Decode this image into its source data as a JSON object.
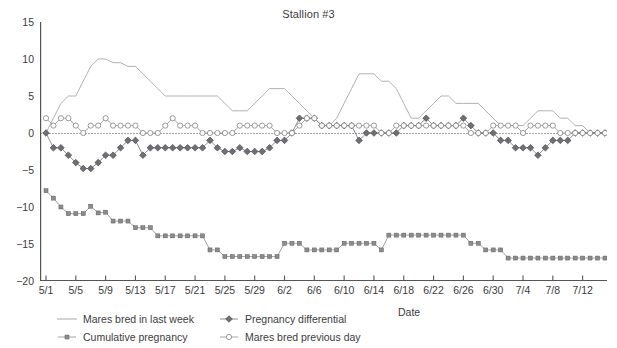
{
  "chart_data": {
    "type": "line",
    "title": "Stallion #3",
    "xlabel": "Date",
    "ylabel": "",
    "ylim": [
      -20,
      15
    ],
    "yticks": [
      15,
      10,
      5,
      0,
      -5,
      -10,
      -15,
      -20
    ],
    "grid": false,
    "zero_reference_line": true,
    "legend_position": "bottom-left",
    "x": [
      "5/1",
      "5/2",
      "5/3",
      "5/4",
      "5/5",
      "5/6",
      "5/7",
      "5/8",
      "5/9",
      "5/10",
      "5/11",
      "5/12",
      "5/13",
      "5/14",
      "5/15",
      "5/16",
      "5/17",
      "5/18",
      "5/19",
      "5/20",
      "5/21",
      "5/22",
      "5/23",
      "5/24",
      "5/25",
      "5/26",
      "5/27",
      "5/28",
      "5/29",
      "5/30",
      "5/31",
      "6/1",
      "6/2",
      "6/3",
      "6/4",
      "6/5",
      "6/6",
      "6/7",
      "6/8",
      "6/9",
      "6/10",
      "6/11",
      "6/12",
      "6/13",
      "6/14",
      "6/15",
      "6/16",
      "6/17",
      "6/18",
      "6/19",
      "6/20",
      "6/21",
      "6/22",
      "6/23",
      "6/24",
      "6/25",
      "6/26",
      "6/27",
      "6/28",
      "6/29",
      "6/30",
      "7/1",
      "7/2",
      "7/3",
      "7/4",
      "7/5",
      "7/6",
      "7/7",
      "7/8",
      "7/9",
      "7/10",
      "7/11",
      "7/12",
      "7/13",
      "7/14",
      "7/15"
    ],
    "xticks": [
      "5/1",
      "5/5",
      "5/9",
      "5/13",
      "5/17",
      "5/21",
      "5/25",
      "5/29",
      "6/2",
      "6/6",
      "6/10",
      "6/14",
      "6/18",
      "6/22",
      "6/26",
      "6/30",
      "7/4",
      "7/8",
      "7/12"
    ],
    "xtick_indices": [
      0,
      4,
      8,
      12,
      16,
      20,
      24,
      28,
      32,
      36,
      40,
      44,
      48,
      52,
      56,
      60,
      64,
      68,
      72
    ],
    "series": [
      {
        "name": "Mares bred in last week",
        "marker": "none",
        "color": "#a8a8a8",
        "values": [
          0,
          2,
          4,
          5,
          5,
          7,
          9,
          10,
          10,
          9.5,
          9.5,
          9,
          9,
          8,
          7,
          6,
          5,
          5,
          5,
          5,
          5,
          5,
          5,
          5,
          4,
          3,
          3,
          3,
          4,
          5,
          6,
          6,
          6,
          5,
          4,
          3,
          2,
          1,
          1,
          2,
          4,
          6,
          8,
          8,
          8,
          7,
          7,
          6,
          4,
          2,
          2,
          3,
          4,
          5,
          5,
          4,
          4,
          4,
          4,
          3,
          2,
          1,
          1,
          1,
          1,
          2,
          3,
          3,
          3,
          2,
          2,
          1,
          1,
          0,
          0,
          0
        ]
      },
      {
        "name": "Cumulative pregnancy",
        "marker": "filled-square",
        "color": "#8c8c8c",
        "values": [
          -7.8,
          -8.8,
          -10,
          -10.9,
          -10.9,
          -10.9,
          -9.9,
          -10.8,
          -10.7,
          -11.9,
          -11.9,
          -11.9,
          -12.8,
          -12.8,
          -12.8,
          -13.9,
          -13.9,
          -13.9,
          -13.9,
          -13.9,
          -13.9,
          -13.9,
          -15.8,
          -15.8,
          -16.7,
          -16.7,
          -16.7,
          -16.7,
          -16.7,
          -16.7,
          -16.7,
          -16.7,
          -14.9,
          -14.9,
          -14.9,
          -15.8,
          -15.8,
          -15.8,
          -15.8,
          -15.8,
          -14.9,
          -14.9,
          -14.9,
          -14.9,
          -14.9,
          -15.8,
          -13.8,
          -13.8,
          -13.8,
          -13.8,
          -13.8,
          -13.8,
          -13.8,
          -13.8,
          -13.8,
          -13.8,
          -13.8,
          -14.9,
          -14.9,
          -15.8,
          -15.8,
          -15.8,
          -16.9,
          -16.9,
          -16.9,
          -16.9,
          -16.9,
          -16.9,
          -16.9,
          -16.9,
          -16.9,
          -16.9,
          -16.9,
          -16.9,
          -16.9,
          -16.9
        ]
      },
      {
        "name": "Pregnancy differential",
        "marker": "filled-diamond",
        "color": "#6e6e74",
        "values": [
          0,
          -2,
          -2,
          -3,
          -4,
          -4.8,
          -4.8,
          -4,
          -3,
          -3,
          -2,
          -1,
          -1,
          -3,
          -2,
          -2,
          -2,
          -2,
          -2,
          -2,
          -2,
          -2,
          -1,
          -2,
          -2.5,
          -2.5,
          -2,
          -2.5,
          -2.5,
          -2.5,
          -2,
          -1,
          -1,
          0,
          2,
          2,
          2,
          1,
          1,
          1,
          1,
          1,
          -1,
          0,
          0,
          0,
          0,
          0,
          1,
          1,
          1,
          2,
          1,
          1,
          1,
          1,
          2,
          1,
          0,
          0,
          0,
          -1,
          -1,
          -2,
          -2,
          -2,
          -3,
          -2,
          -1,
          -1,
          -1,
          0,
          0,
          0,
          0,
          0
        ]
      },
      {
        "name": "Mares bred previous day",
        "marker": "open-circle",
        "color": "#8e8e8e",
        "values": [
          2,
          1,
          2,
          2,
          1,
          0,
          1,
          1,
          2,
          1,
          1,
          1,
          1,
          0,
          0,
          0,
          1,
          2,
          1,
          1,
          1,
          0,
          0,
          0,
          0,
          0,
          1,
          1,
          1,
          1,
          1,
          0,
          0,
          0,
          1,
          2,
          2,
          1,
          1,
          1,
          1,
          1,
          1,
          1,
          1,
          0,
          0,
          1,
          1,
          1,
          1,
          1,
          1,
          1,
          1,
          1,
          1,
          0,
          0,
          0,
          1,
          1,
          1,
          1,
          0,
          1,
          1,
          1,
          1,
          0,
          0,
          0,
          0,
          0,
          0,
          0
        ]
      }
    ]
  },
  "axes": {
    "x_title": "Date"
  },
  "legend": {
    "entries": [
      {
        "label": "Mares bred in last week",
        "marker": "line",
        "color": "#a8a8a8"
      },
      {
        "label": "Pregnancy differential",
        "marker": "filled-diamond",
        "color": "#6e6e74"
      },
      {
        "label": "Cumulative pregnancy",
        "marker": "filled-square",
        "color": "#8c8c8c"
      },
      {
        "label": "Mares bred previous day",
        "marker": "open-circle",
        "color": "#8e8e8e"
      }
    ]
  },
  "colors": {
    "axis": "#555555",
    "text": "#3c3c3c",
    "background": "#ffffff"
  }
}
